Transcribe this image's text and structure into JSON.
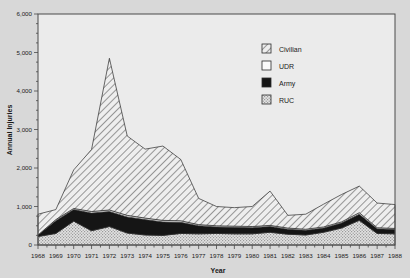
{
  "chart_data": {
    "type": "area",
    "stacked": true,
    "title": "",
    "xlabel": "Year",
    "ylabel": "Annual Injuries",
    "categories": [
      1968,
      1969,
      1970,
      1971,
      1972,
      1973,
      1974,
      1975,
      1976,
      1977,
      1978,
      1979,
      1980,
      1981,
      1982,
      1983,
      1984,
      1985,
      1986,
      1987,
      1988
    ],
    "x": [
      "1968",
      "1969",
      "1970",
      "1971",
      "1972",
      "1973",
      "1974",
      "1975",
      "1976",
      "1977",
      "1978",
      "1979",
      "1980",
      "1981",
      "1982",
      "1983",
      "1984",
      "1985",
      "1986",
      "1987",
      "1988"
    ],
    "ylim": [
      0,
      6000
    ],
    "ytick_labels": [
      "0",
      "1,000",
      "2,000",
      "3,000",
      "4,000",
      "5,000",
      "6,000"
    ],
    "ytick_values": [
      0,
      1000,
      2000,
      3000,
      4000,
      5000,
      6000
    ],
    "grid": false,
    "legend_position": "top-right",
    "series": [
      {
        "name": "RUC",
        "fill": "stipple-light",
        "color": "#d0d0d0",
        "values": [
          220,
          300,
          620,
          370,
          480,
          310,
          260,
          250,
          300,
          290,
          300,
          290,
          290,
          330,
          280,
          260,
          330,
          440,
          640,
          300,
          290
        ]
      },
      {
        "name": "Army",
        "fill": "solid-black",
        "color": "#151515",
        "values": [
          40,
          330,
          300,
          460,
          390,
          420,
          400,
          350,
          290,
          210,
          170,
          170,
          160,
          150,
          130,
          120,
          110,
          130,
          160,
          120,
          110
        ]
      },
      {
        "name": "UDR",
        "fill": "white",
        "color": "#ffffff",
        "values": [
          0,
          30,
          30,
          40,
          40,
          40,
          40,
          40,
          40,
          30,
          30,
          30,
          30,
          30,
          30,
          30,
          30,
          30,
          40,
          30,
          30
        ]
      },
      {
        "name": "Civilian",
        "fill": "diagonal-hatch",
        "color": "#e6e6e6",
        "values": [
          540,
          260,
          1000,
          1610,
          3940,
          2060,
          1790,
          1930,
          1590,
          680,
          500,
          480,
          520,
          890,
          330,
          390,
          590,
          710,
          690,
          640,
          620
        ]
      }
    ],
    "totals": [
      800,
      920,
      1950,
      2440,
      4850,
      2830,
      2490,
      2570,
      2220,
      1210,
      1000,
      970,
      1000,
      1400,
      770,
      800,
      1060,
      1310,
      1530,
      1090,
      1050
    ],
    "peak": {
      "year": "1972",
      "value": 4850
    }
  },
  "legend": {
    "entries": [
      {
        "label": "Civilian",
        "swatch": "diagonal-hatch"
      },
      {
        "label": "UDR",
        "swatch": "white"
      },
      {
        "label": "Army",
        "swatch": "solid-black"
      },
      {
        "label": "RUC",
        "swatch": "stipple-light"
      }
    ]
  },
  "colors": {
    "page_background": "#d8d8d8",
    "plot_background": "#ebebeb",
    "frame": "#4a4a4a",
    "text": "#1a1a1a"
  }
}
